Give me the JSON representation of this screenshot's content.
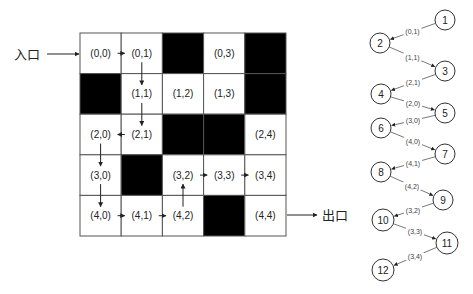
{
  "maze": {
    "entrance_label": "入口",
    "exit_label": "出口",
    "rows": 5,
    "cols": 5,
    "origin": {
      "x": 80,
      "y": 33
    },
    "cell_w": 41.2,
    "cell_h": 40.6,
    "colors": {
      "wall": "#000000",
      "open": "#ffffff",
      "grid": "#555555"
    },
    "cells": [
      [
        {
          "type": "open",
          "label": "(0,0)"
        },
        {
          "type": "open",
          "label": "(0,1)"
        },
        {
          "type": "wall",
          "label": ""
        },
        {
          "type": "open",
          "label": "(0,3)"
        },
        {
          "type": "wall",
          "label": ""
        }
      ],
      [
        {
          "type": "wall",
          "label": ""
        },
        {
          "type": "open",
          "label": "(1,1)"
        },
        {
          "type": "open",
          "label": "(1,2)"
        },
        {
          "type": "open",
          "label": "(1,3)"
        },
        {
          "type": "wall",
          "label": ""
        }
      ],
      [
        {
          "type": "open",
          "label": "(2,0)"
        },
        {
          "type": "open",
          "label": "(2,1)"
        },
        {
          "type": "wall",
          "label": ""
        },
        {
          "type": "wall",
          "label": ""
        },
        {
          "type": "open",
          "label": "(2,4)"
        }
      ],
      [
        {
          "type": "open",
          "label": "(3,0)"
        },
        {
          "type": "wall",
          "label": ""
        },
        {
          "type": "open",
          "label": "(3,2)"
        },
        {
          "type": "open",
          "label": "(3,3)"
        },
        {
          "type": "open",
          "label": "(3,4)"
        }
      ],
      [
        {
          "type": "open",
          "label": "(4,0)"
        },
        {
          "type": "open",
          "label": "(4,1)"
        },
        {
          "type": "open",
          "label": "(4,2)"
        },
        {
          "type": "wall",
          "label": ""
        },
        {
          "type": "open",
          "label": "(4,4)"
        }
      ]
    ],
    "path_moves": [
      {
        "from": [
          0,
          0
        ],
        "to": [
          0,
          1
        ]
      },
      {
        "from": [
          0,
          1
        ],
        "to": [
          1,
          1
        ]
      },
      {
        "from": [
          1,
          1
        ],
        "to": [
          2,
          1
        ]
      },
      {
        "from": [
          2,
          1
        ],
        "to": [
          2,
          0
        ]
      },
      {
        "from": [
          2,
          0
        ],
        "to": [
          3,
          0
        ]
      },
      {
        "from": [
          3,
          0
        ],
        "to": [
          4,
          0
        ]
      },
      {
        "from": [
          4,
          0
        ],
        "to": [
          4,
          1
        ]
      },
      {
        "from": [
          4,
          1
        ],
        "to": [
          4,
          2
        ]
      },
      {
        "from": [
          4,
          2
        ],
        "to": [
          3,
          2
        ]
      },
      {
        "from": [
          3,
          2
        ],
        "to": [
          3,
          3
        ]
      },
      {
        "from": [
          3,
          3
        ],
        "to": [
          3,
          4
        ]
      }
    ]
  },
  "tree": {
    "nodes": [
      {
        "id": "1",
        "x": 445,
        "y": 20,
        "r": 10
      },
      {
        "id": "2",
        "x": 380,
        "y": 43,
        "r": 10
      },
      {
        "id": "3",
        "x": 445,
        "y": 71,
        "r": 10
      },
      {
        "id": "4",
        "x": 381,
        "y": 94,
        "r": 10
      },
      {
        "id": "5",
        "x": 445,
        "y": 113,
        "r": 10
      },
      {
        "id": "6",
        "x": 381,
        "y": 128,
        "r": 10
      },
      {
        "id": "7",
        "x": 445,
        "y": 154,
        "r": 10
      },
      {
        "id": "8",
        "x": 381,
        "y": 172,
        "r": 10
      },
      {
        "id": "9",
        "x": 443,
        "y": 200,
        "r": 10
      },
      {
        "id": "10",
        "x": 383,
        "y": 220,
        "r": 11
      },
      {
        "id": "11",
        "x": 447,
        "y": 243,
        "r": 11
      },
      {
        "id": "12",
        "x": 383,
        "y": 270,
        "r": 11
      }
    ],
    "edges": [
      {
        "from": "1",
        "to": "2",
        "label": "(0,1)"
      },
      {
        "from": "2",
        "to": "3",
        "label": "(1,1)"
      },
      {
        "from": "3",
        "to": "4",
        "label": "(2,1)"
      },
      {
        "from": "4",
        "to": "5",
        "label": "(2,0)"
      },
      {
        "from": "5",
        "to": "6",
        "label": "(3,0)"
      },
      {
        "from": "6",
        "to": "7",
        "label": "(4,0)"
      },
      {
        "from": "7",
        "to": "8",
        "label": "(4,1)"
      },
      {
        "from": "8",
        "to": "9",
        "label": "(4,2)"
      },
      {
        "from": "9",
        "to": "10",
        "label": "(3,2)"
      },
      {
        "from": "10",
        "to": "11",
        "label": "(3,3)"
      },
      {
        "from": "11",
        "to": "12",
        "label": "(3,4)"
      }
    ]
  }
}
